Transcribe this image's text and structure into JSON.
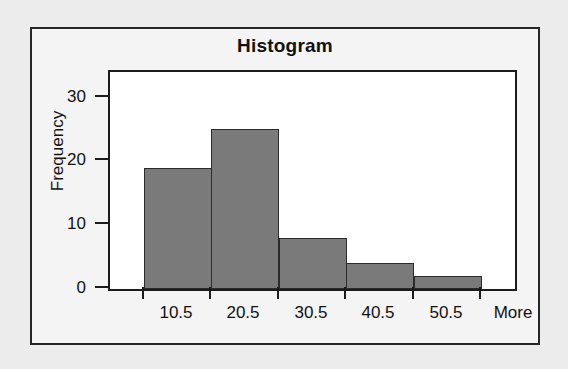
{
  "chart_data": {
    "type": "bar",
    "title": "Histogram",
    "xlabel": "",
    "ylabel": "Frequency",
    "categories": [
      "10.5",
      "20.5",
      "30.5",
      "40.5",
      "50.5",
      "More"
    ],
    "values": [
      19,
      25,
      8,
      4,
      2,
      0
    ],
    "ylim": [
      0,
      34
    ],
    "ytick_labels": [
      "0",
      "10",
      "20",
      "30"
    ],
    "ytick_values": [
      0,
      10,
      20,
      30
    ],
    "grid": false,
    "legend": false,
    "bar_color": "#7a7a7a",
    "bar_edge_color": "#2b2b2b",
    "axis_color": "#1c1c1c",
    "plot_background": "#ffffff",
    "figure_background": "#f4f4f4",
    "page_background": "#ececec"
  }
}
